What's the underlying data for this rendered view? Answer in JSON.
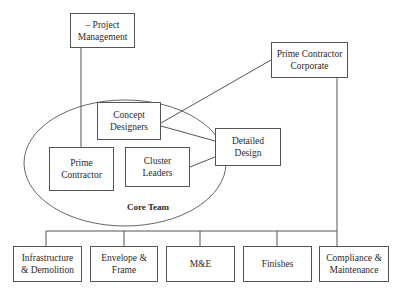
{
  "diagram": {
    "type": "organizational-chart",
    "ellipse_label": "Core Team",
    "nodes": {
      "project_management": "– Project Management",
      "prime_contractor_corporate": "Prime Contractor Corporate",
      "concept_designers": "Concept Designers",
      "prime_contractor": "Prime Contractor",
      "cluster_leaders": "Cluster Leaders",
      "detailed_design": "Detailed Design",
      "infrastructure": "Infrastructure & Demolition",
      "envelope": "Envelope & Frame",
      "mande": "M&E",
      "finishes": "Finishes",
      "compliance": "Compliance & Maintenance"
    },
    "edges": [
      [
        "project_management",
        "prime_contractor"
      ],
      [
        "concept_designers",
        "prime_contractor_corporate"
      ],
      [
        "concept_designers",
        "detailed_design"
      ],
      [
        "cluster_leaders",
        "detailed_design"
      ],
      [
        "prime_contractor_corporate",
        "infrastructure"
      ],
      [
        "prime_contractor_corporate",
        "envelope"
      ],
      [
        "prime_contractor_corporate",
        "mande"
      ],
      [
        "prime_contractor_corporate",
        "finishes"
      ],
      [
        "prime_contractor_corporate",
        "compliance"
      ]
    ],
    "line_color": "#555555"
  }
}
